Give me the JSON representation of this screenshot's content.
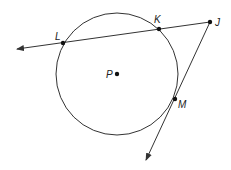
{
  "diagram": {
    "title": "",
    "circle": {
      "center_label": "P",
      "cx": 117,
      "cy": 74,
      "r": 61
    },
    "points": [
      {
        "id": "L",
        "label": "L",
        "x": 63,
        "y": 43,
        "lx": 55,
        "ly": 40
      },
      {
        "id": "K",
        "label": "K",
        "x": 159,
        "y": 29,
        "lx": 154,
        "ly": 23
      },
      {
        "id": "J",
        "label": "J",
        "x": 210,
        "y": 22,
        "lx": 215,
        "ly": 26
      },
      {
        "id": "M",
        "label": "M",
        "x": 175,
        "y": 99,
        "lx": 178,
        "ly": 108
      },
      {
        "id": "P",
        "label": "P",
        "x": 117,
        "y": 74,
        "lx": 106,
        "ly": 78
      }
    ],
    "rays": [
      {
        "name": "secant-ray-JL",
        "from": "J",
        "to_x": 17,
        "to_y": 49
      },
      {
        "name": "tangent-ray-JM",
        "from": "J",
        "to_x": 146,
        "to_y": 160
      }
    ],
    "colors": {
      "stroke": "#333333",
      "background": "#ffffff"
    }
  }
}
